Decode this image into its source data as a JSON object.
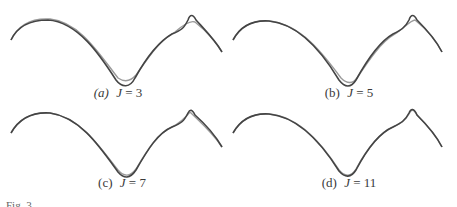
{
  "figure": {
    "panels": [
      {
        "id": "a",
        "tag": "(a)",
        "tag_italic": true,
        "variable": "J",
        "equals": "=",
        "value": "3"
      },
      {
        "id": "b",
        "tag": "(b)",
        "tag_italic": false,
        "variable": "J",
        "equals": "=",
        "value": "5"
      },
      {
        "id": "c",
        "tag": "(c)",
        "tag_italic": false,
        "variable": "J",
        "equals": "=",
        "value": "7"
      },
      {
        "id": "d",
        "tag": "(d)",
        "tag_italic": false,
        "variable": "J",
        "equals": "=",
        "value": "11"
      }
    ],
    "caption_partial": "Fig. 3.",
    "colors": {
      "original_curve": "#444444",
      "approx_curve": "#999999"
    }
  }
}
